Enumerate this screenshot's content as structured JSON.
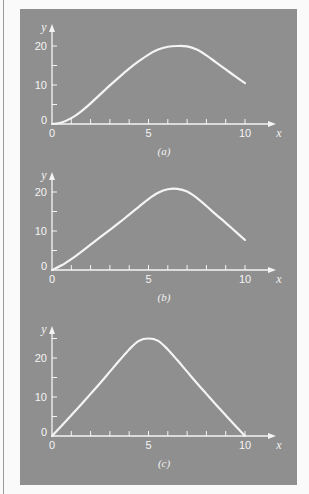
{
  "figure": {
    "background_color": "#8f8f8f",
    "ink_color": "#f4f4f4"
  },
  "chart_data": [
    {
      "type": "line",
      "caption": "(a)",
      "xlabel": "x",
      "ylabel": "y",
      "xlim": [
        0,
        10
      ],
      "ylim": [
        0,
        22
      ],
      "x_ticks": [
        0,
        1,
        2,
        3,
        4,
        5,
        6,
        7,
        8,
        9,
        10
      ],
      "x_tick_labels": [
        "0",
        "5",
        "10"
      ],
      "y_ticks": [
        0,
        5,
        10,
        15,
        20
      ],
      "y_tick_labels": [
        "0",
        "10",
        "20"
      ],
      "grid": false,
      "series": [
        {
          "name": "curve-a",
          "x": [
            0,
            0.5,
            1,
            1.5,
            2,
            2.5,
            3,
            3.5,
            4,
            4.5,
            5,
            5.5,
            6,
            6.5,
            7,
            7.5,
            8,
            8.5,
            9,
            9.5,
            10
          ],
          "y": [
            0,
            0.4,
            1.5,
            3.2,
            5.3,
            7.6,
            9.9,
            12.1,
            14.2,
            16.1,
            17.8,
            19.1,
            19.8,
            20.0,
            19.9,
            19.1,
            17.6,
            15.8,
            14.0,
            12.2,
            10.5
          ]
        }
      ]
    },
    {
      "type": "line",
      "caption": "(b)",
      "xlabel": "x",
      "ylabel": "y",
      "xlim": [
        0,
        10
      ],
      "ylim": [
        0,
        22
      ],
      "x_ticks": [
        0,
        1,
        2,
        3,
        4,
        5,
        6,
        7,
        8,
        9,
        10
      ],
      "x_tick_labels": [
        "0",
        "5",
        "10"
      ],
      "y_ticks": [
        0,
        5,
        10,
        15,
        20
      ],
      "y_tick_labels": [
        "0",
        "10",
        "20"
      ],
      "grid": false,
      "series": [
        {
          "name": "curve-b",
          "x": [
            0,
            0.5,
            1,
            1.5,
            2,
            2.5,
            3,
            3.5,
            4,
            4.5,
            5,
            5.5,
            6,
            6.5,
            7,
            7.5,
            8,
            8.5,
            9,
            9.5,
            10
          ],
          "y": [
            0,
            1.2,
            2.8,
            4.6,
            6.5,
            8.4,
            10.3,
            12.2,
            14.2,
            16.2,
            18.2,
            19.8,
            20.7,
            20.8,
            20.1,
            18.5,
            16.4,
            14.2,
            12.1,
            9.9,
            7.7
          ]
        }
      ]
    },
    {
      "type": "line",
      "caption": "(c)",
      "xlabel": "x",
      "ylabel": "y",
      "xlim": [
        0,
        10
      ],
      "ylim": [
        0,
        28
      ],
      "x_ticks": [
        0,
        1,
        2,
        3,
        4,
        5,
        6,
        7,
        8,
        9,
        10
      ],
      "x_tick_labels": [
        "0",
        "5",
        "10"
      ],
      "y_ticks": [
        0,
        5,
        10,
        15,
        20,
        25
      ],
      "y_tick_labels": [
        "0",
        "10",
        "20"
      ],
      "grid": false,
      "series": [
        {
          "name": "curve-c",
          "x": [
            0,
            0.5,
            1,
            1.5,
            2,
            2.5,
            3,
            3.5,
            4,
            4.5,
            5,
            5.5,
            6,
            6.5,
            7,
            7.5,
            8,
            8.5,
            9,
            9.5,
            10
          ],
          "y": [
            0,
            2.6,
            5.3,
            8.0,
            10.8,
            13.6,
            16.5,
            19.4,
            22.2,
            24.4,
            25.0,
            24.4,
            22.2,
            19.4,
            16.5,
            13.6,
            10.8,
            8.0,
            5.3,
            2.6,
            0
          ]
        }
      ]
    }
  ]
}
